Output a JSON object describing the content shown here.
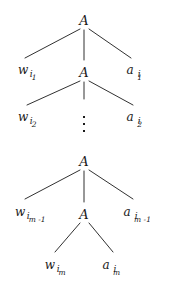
{
  "figure": {
    "type": "parse-tree",
    "background_color": "#ffffff",
    "ink_color": "#1a1a1a"
  },
  "nodes": [
    {
      "id": "A1",
      "label": "A",
      "x": 84,
      "y": 20
    },
    {
      "id": "A2",
      "label": "A",
      "x": 84,
      "y": 72
    },
    {
      "id": "A3",
      "label": "A",
      "x": 84,
      "y": 161
    },
    {
      "id": "A4",
      "label": "A",
      "x": 84,
      "y": 214
    }
  ],
  "leaves": [
    {
      "id": "w1",
      "base": "w",
      "sub1": "i",
      "sub2": "1",
      "x": 27,
      "y": 70,
      "gap": false
    },
    {
      "id": "a1",
      "base": "a",
      "sub1": "i",
      "sub2": "1",
      "x": 134,
      "y": 70,
      "gap": true
    },
    {
      "id": "w2",
      "base": "w",
      "sub1": "i",
      "sub2": "2",
      "x": 27,
      "y": 117,
      "gap": false
    },
    {
      "id": "a2",
      "base": "a",
      "sub1": "i",
      "sub2": "2",
      "x": 134,
      "y": 117,
      "gap": true
    },
    {
      "id": "wm1",
      "base": "w",
      "sub1": "i",
      "sub2": "m -1",
      "x": 30,
      "y": 212,
      "gap": false
    },
    {
      "id": "am1",
      "base": "a",
      "sub1": "i",
      "sub2": "m -1",
      "x": 137,
      "y": 212,
      "gap": true
    },
    {
      "id": "wm",
      "base": "w",
      "sub1": "i",
      "sub2": "m",
      "x": 55,
      "y": 265,
      "gap": false
    },
    {
      "id": "am",
      "base": "a",
      "sub1": "i",
      "sub2": "m",
      "x": 111,
      "y": 265,
      "gap": true
    }
  ],
  "ellipsis": {
    "id": "vdots",
    "x": 84,
    "y": 124,
    "dots": 3
  },
  "edges": [
    {
      "id": "e-A1-w1",
      "x1": 80,
      "y1": 29,
      "x2": 25,
      "y2": 58
    },
    {
      "id": "e-A1-A2",
      "x1": 84,
      "y1": 30,
      "x2": 84,
      "y2": 60
    },
    {
      "id": "e-A1-a1",
      "x1": 89,
      "y1": 29,
      "x2": 131,
      "y2": 58
    },
    {
      "id": "e-A2-w2",
      "x1": 80,
      "y1": 81,
      "x2": 27,
      "y2": 105
    },
    {
      "id": "e-A2-mid",
      "x1": 84,
      "y1": 82,
      "x2": 84,
      "y2": 99
    },
    {
      "id": "e-A2-a2",
      "x1": 89,
      "y1": 81,
      "x2": 133,
      "y2": 105
    },
    {
      "id": "e-A3-wm1",
      "x1": 80,
      "y1": 170,
      "x2": 25,
      "y2": 199
    },
    {
      "id": "e-A3-A4",
      "x1": 84,
      "y1": 171,
      "x2": 84,
      "y2": 202
    },
    {
      "id": "e-A3-am1",
      "x1": 89,
      "y1": 170,
      "x2": 133,
      "y2": 199
    },
    {
      "id": "e-A4-wm",
      "x1": 80,
      "y1": 223,
      "x2": 55,
      "y2": 252
    },
    {
      "id": "e-A4-am",
      "x1": 89,
      "y1": 223,
      "x2": 113,
      "y2": 252
    }
  ]
}
